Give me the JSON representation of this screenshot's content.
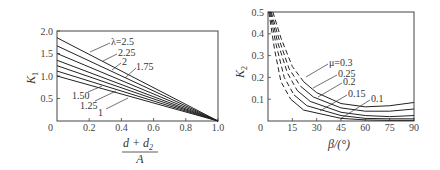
{
  "chart_data": [
    {
      "type": "line",
      "title": "",
      "xlabel": "(d + d2) / A",
      "xlabel_numerator": "d + d",
      "xlabel_numerator_sub": "2",
      "xlabel_denominator": "A",
      "ylabel": "K",
      "ylabel_sub": "1",
      "xlim": [
        0,
        1.0
      ],
      "ylim": [
        0,
        2.0
      ],
      "x_ticks": [
        "0.2",
        "0.4",
        "0.6",
        "0.8",
        "1.0"
      ],
      "y_ticks": [
        "0.5",
        "1.0",
        "1.5",
        "2.0"
      ],
      "origin_label": "0",
      "legend_prefix": "λ=",
      "series": [
        {
          "name": "λ=2.5",
          "label": "λ=2.5",
          "x": [
            0,
            1.0
          ],
          "values": [
            1.85,
            0
          ]
        },
        {
          "name": "2.25",
          "label": "2.25",
          "x": [
            0,
            1.0
          ],
          "values": [
            1.67,
            0
          ]
        },
        {
          "name": "2",
          "label": "2",
          "x": [
            0,
            1.0
          ],
          "values": [
            1.5,
            0
          ]
        },
        {
          "name": "1.75",
          "label": "1.75",
          "x": [
            0,
            1.0
          ],
          "values": [
            1.35,
            0
          ]
        },
        {
          "name": "1.50",
          "label": "1.50",
          "x": [
            0,
            1.0
          ],
          "values": [
            1.23,
            0
          ]
        },
        {
          "name": "1.25",
          "label": "1.25",
          "x": [
            0,
            1.0
          ],
          "values": [
            1.11,
            0
          ]
        },
        {
          "name": "1",
          "label": "1",
          "x": [
            0,
            1.0
          ],
          "values": [
            1.0,
            0
          ]
        }
      ],
      "grid": false
    },
    {
      "type": "line",
      "title": "",
      "xlabel": "β/(°)",
      "ylabel": "K",
      "ylabel_sub": "2",
      "xlim": [
        0,
        90
      ],
      "ylim": [
        0,
        0.5
      ],
      "x_ticks": [
        "15",
        "30",
        "45",
        "60",
        "75",
        "90"
      ],
      "y_ticks": [
        "0.1",
        "0.2",
        "0.3",
        "0.4",
        "0.5"
      ],
      "origin_label": "0",
      "note": "Dashed segments at small β, solid beyond",
      "series": [
        {
          "name": "μ=0.3",
          "label": "μ=0.3",
          "x": [
            3,
            8,
            15,
            22,
            30,
            45,
            60,
            75,
            90
          ],
          "values": [
            0.5,
            0.38,
            0.25,
            0.18,
            0.13,
            0.08,
            0.065,
            0.07,
            0.085
          ]
        },
        {
          "name": "0.25",
          "label": "0.25",
          "x": [
            2,
            7,
            13,
            20,
            28,
            45,
            60,
            75,
            90
          ],
          "values": [
            0.5,
            0.37,
            0.24,
            0.16,
            0.11,
            0.06,
            0.045,
            0.045,
            0.055
          ]
        },
        {
          "name": "0.2",
          "label": "0.2",
          "x": [
            1.5,
            6,
            12,
            18,
            26,
            45,
            60,
            75,
            90
          ],
          "values": [
            0.5,
            0.36,
            0.22,
            0.14,
            0.09,
            0.04,
            0.025,
            0.02,
            0.025
          ]
        },
        {
          "name": "0.15",
          "label": "0.15",
          "x": [
            1,
            5,
            10,
            16,
            24,
            45,
            60,
            75,
            90
          ],
          "values": [
            0.5,
            0.35,
            0.2,
            0.12,
            0.07,
            0.025,
            0.012,
            0.01,
            0.01
          ]
        },
        {
          "name": "0.1",
          "label": "0.1",
          "x": [
            0.5,
            4,
            8,
            14,
            22,
            45,
            60,
            75,
            90
          ],
          "values": [
            0.5,
            0.33,
            0.18,
            0.1,
            0.05,
            0.012,
            0.005,
            0.003,
            0.003
          ]
        }
      ],
      "grid": false
    }
  ]
}
